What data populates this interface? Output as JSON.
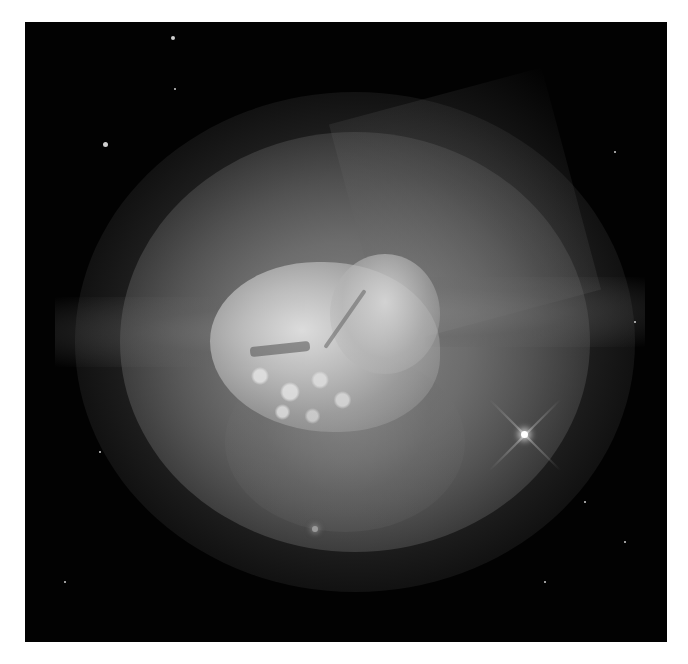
{
  "image": {
    "subject": "planetary nebula photograph",
    "color_mode": "grayscale",
    "border_color": "#ffffff",
    "background_color": "#020202",
    "frame": {
      "left": 25,
      "top": 22,
      "width": 642,
      "height": 620
    }
  },
  "features": {
    "bright_star": {
      "x": 498,
      "y": 410,
      "has_diffraction_spikes": true
    },
    "faint_star_bottom": {
      "x": 290,
      "y": 507
    },
    "small_stars": [
      {
        "x": 80,
        "y": 122,
        "r": 2.5
      },
      {
        "x": 148,
        "y": 16,
        "r": 2
      },
      {
        "x": 150,
        "y": 67,
        "r": 1.2
      },
      {
        "x": 75,
        "y": 430,
        "r": 1.2
      },
      {
        "x": 590,
        "y": 130,
        "r": 1.2
      },
      {
        "x": 600,
        "y": 520,
        "r": 1
      },
      {
        "x": 520,
        "y": 560,
        "r": 1.2
      },
      {
        "x": 40,
        "y": 560,
        "r": 1
      },
      {
        "x": 610,
        "y": 300,
        "r": 1
      },
      {
        "x": 560,
        "y": 480,
        "r": 1.2
      }
    ]
  }
}
